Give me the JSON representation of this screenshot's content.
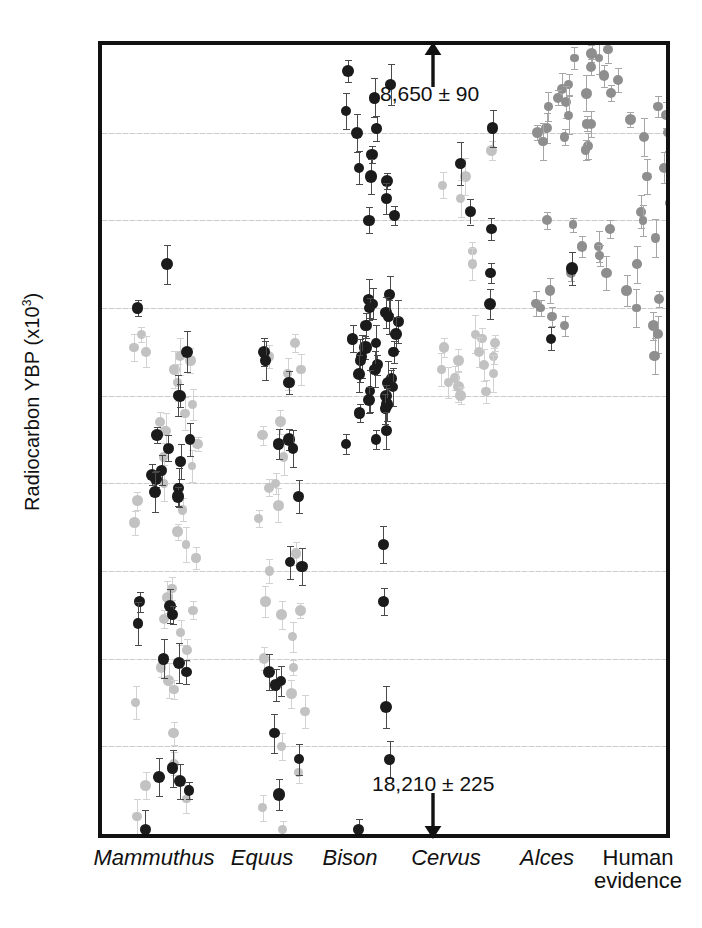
{
  "chart_data": {
    "type": "scatter",
    "title": "",
    "xlabel": "",
    "ylabel": "Radiocarbon YBP (x10³)",
    "ylabel_main": "Radiocarbon YBP (x10",
    "ylabel_sup": "3",
    "ylabel_tail": ")",
    "y_axis_inverted": true,
    "ylim": [
      9,
      18
    ],
    "yticks": [
      9,
      10,
      11,
      12,
      13,
      14,
      15,
      16,
      17,
      18
    ],
    "ytick_labels": [
      "9",
      "10",
      "11",
      "12",
      "13",
      "14",
      "15",
      "16",
      "17",
      "18"
    ],
    "gridlines_at": [
      10,
      11,
      12,
      13,
      14,
      15,
      16,
      17
    ],
    "grid": true,
    "legend": "none",
    "categories": [
      "Mammuthus",
      "Equus",
      "Bison",
      "Cervus",
      "Alces",
      "Human evidence"
    ],
    "category_styles": [
      "italic",
      "italic",
      "italic",
      "italic",
      "italic",
      "roman"
    ],
    "colors": {
      "dark_point": "#1b1b1b",
      "mid_point": "#8e8e8e",
      "light_point": "#c2c2c2",
      "frame": "#111111",
      "grid": "#c9c9c9"
    },
    "annotations": [
      {
        "text": "8,650 ± 90",
        "arrow": "up",
        "near_category": "Cervus",
        "meaning": "youngest date, off-scale above 9"
      },
      {
        "text": "18,210 ± 225",
        "arrow": "down",
        "near_category": "Cervus",
        "meaning": "oldest date, off-scale below 18"
      }
    ],
    "series": [
      {
        "name": "Mammuthus",
        "x_index": 0,
        "points_dark": [
          11.5,
          12.0,
          12.5,
          13.0,
          13.0,
          13.45,
          13.5,
          13.6,
          13.75,
          13.85,
          13.9,
          13.95,
          14.05,
          14.1,
          14.15,
          15.35,
          15.4,
          15.5,
          15.6,
          16.0,
          16.05,
          16.15,
          17.25,
          17.35,
          17.4,
          17.5,
          17.95
        ],
        "points_light": [
          12.3,
          12.45,
          12.5,
          12.55,
          12.6,
          12.7,
          12.85,
          13.1,
          13.2,
          13.3,
          13.4,
          13.55,
          13.7,
          13.8,
          14.0,
          14.2,
          14.3,
          14.45,
          14.55,
          14.7,
          14.85,
          15.2,
          15.3,
          15.45,
          15.55,
          15.7,
          15.9,
          16.1,
          16.25,
          16.35,
          16.5,
          16.85,
          17.2,
          17.45,
          17.6,
          17.8
        ]
      },
      {
        "name": "Equus",
        "x_index": 1,
        "points_dark": [
          12.5,
          12.6,
          12.85,
          13.5,
          13.55,
          13.6,
          14.15,
          14.9,
          14.95,
          16.15,
          16.25,
          16.3,
          16.85,
          17.15,
          17.55
        ],
        "points_light": [
          12.4,
          12.55,
          12.7,
          12.75,
          13.3,
          13.45,
          13.7,
          14.0,
          14.05,
          14.25,
          14.4,
          14.8,
          15.0,
          15.35,
          15.45,
          15.5,
          15.75,
          16.0,
          16.1,
          16.4,
          16.6,
          17.0,
          17.3,
          17.7,
          17.95
        ]
      },
      {
        "name": "Bison",
        "x_index": 2,
        "points_dark": [
          9.3,
          9.45,
          9.6,
          9.75,
          9.95,
          10.0,
          10.25,
          10.4,
          10.5,
          10.55,
          10.75,
          10.95,
          11.0,
          11.85,
          11.9,
          11.95,
          12.0,
          12.05,
          12.1,
          12.15,
          12.2,
          12.3,
          12.35,
          12.4,
          12.45,
          12.5,
          12.55,
          12.6,
          12.65,
          12.7,
          12.75,
          12.8,
          12.85,
          12.9,
          12.95,
          13.0,
          13.05,
          13.1,
          13.15,
          13.2,
          13.4,
          13.5,
          13.55,
          14.7,
          15.35,
          16.55,
          17.15,
          17.95
        ],
        "points_light": []
      },
      {
        "name": "Cervus",
        "x_index": 3,
        "points_dark": [
          9.95,
          10.35,
          10.9,
          11.1,
          11.6,
          11.95
        ],
        "points_light": [
          10.2,
          10.5,
          10.6,
          10.75,
          11.35,
          11.5,
          12.3,
          12.35,
          12.4,
          12.45,
          12.5,
          12.55,
          12.6,
          12.65,
          12.7,
          12.75,
          12.8,
          12.85,
          12.9,
          12.95,
          13.0
        ]
      },
      {
        "name": "Alces",
        "x_index": 4,
        "points_dark": [
          11.55,
          12.35
        ],
        "points_light": [
          9.15,
          9.45,
          9.5,
          9.55,
          9.6,
          9.65,
          9.7,
          9.8,
          9.9,
          9.95,
          10.0,
          10.05,
          10.1,
          10.15,
          10.2,
          11.0,
          11.05,
          11.3,
          11.6,
          11.8,
          11.95,
          12.0,
          12.1,
          12.2
        ]
      },
      {
        "name": "Human evidence",
        "x_index": 5,
        "points_dark": [],
        "points_light": [
          9.05,
          9.1,
          9.15,
          9.2,
          9.25,
          9.3,
          9.35,
          9.4,
          9.45,
          9.5,
          9.55,
          9.6,
          9.65,
          9.7,
          9.75,
          9.8,
          9.85,
          9.9,
          9.95,
          10.0,
          10.05,
          10.1,
          10.15,
          10.2,
          10.3,
          10.4,
          10.5,
          10.6,
          10.7,
          10.8,
          10.9,
          11.0,
          11.1,
          11.2,
          11.3,
          11.4,
          11.5,
          11.6,
          11.7,
          11.8,
          11.9,
          12.0,
          12.1,
          12.2,
          12.3,
          12.55
        ]
      }
    ]
  },
  "axis": {
    "y_title_main": "Radiocarbon YBP (x10",
    "y_title_sup": "3",
    "y_title_tail": ")"
  },
  "annotations": {
    "top": {
      "text": "8,650 ± 90",
      "arrow_name": "up-arrow-icon"
    },
    "bottom": {
      "text": "18,210 ± 225",
      "arrow_name": "down-arrow-icon"
    }
  },
  "xlabels": {
    "c0": "Mammuthus",
    "c1": "Equus",
    "c2": "Bison",
    "c3": "Cervus",
    "c4": "Alces",
    "c5a": "Human",
    "c5b": "evidence"
  },
  "yticks": {
    "t9": "9",
    "t10": "10",
    "t11": "11",
    "t12": "12",
    "t13": "13",
    "t14": "14",
    "t15": "15",
    "t16": "16",
    "t17": "17",
    "t18": "18"
  }
}
